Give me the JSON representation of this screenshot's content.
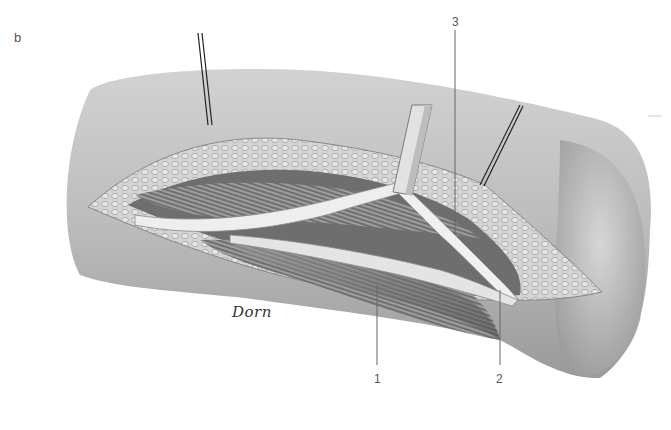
{
  "figure": {
    "panel_letter": "b",
    "signature": "Dorn",
    "labels": [
      {
        "id": "1",
        "text": "1",
        "x": 374,
        "y": 372
      },
      {
        "id": "2",
        "text": "2",
        "x": 496,
        "y": 372
      },
      {
        "id": "3",
        "text": "3",
        "x": 452,
        "y": 15
      }
    ],
    "colors": {
      "skin": "#bdbdbd",
      "skin_dark": "#8e8e8e",
      "fat": "#d6d6d6",
      "muscle": "#7a7a7a",
      "nerve": "#ececec",
      "leader_line": "#666666",
      "retractor": "#222222"
    }
  }
}
